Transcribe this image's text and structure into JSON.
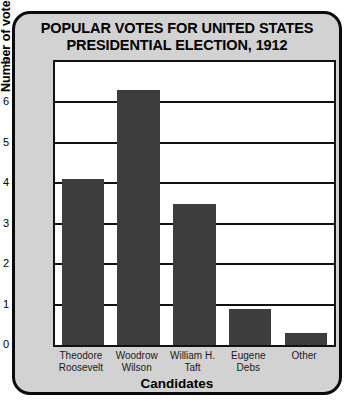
{
  "chart_data": {
    "type": "bar",
    "title": "POPULAR VOTES FOR UNITED STATES PRESIDENTIAL ELECTION, 1912",
    "title_lines": [
      "POPULAR VOTES FOR UNITED STATES",
      "PRESIDENTIAL ELECTION, 1912"
    ],
    "categories": [
      "Theodore Roosevelt",
      "Woodrow Wilson",
      "William H. Taft",
      "Eugene Debs",
      "Other"
    ],
    "category_lines": [
      [
        "Theodore",
        "Roosevelt"
      ],
      [
        "Woodrow",
        "Wilson"
      ],
      [
        "William H.",
        "Taft"
      ],
      [
        "Eugene",
        "Debs"
      ],
      [
        "Other",
        ""
      ]
    ],
    "values": [
      4.1,
      6.3,
      3.5,
      0.9,
      0.3
    ],
    "xlabel": "Candidates",
    "ylabel": "Number of votes (millions)",
    "ylim": [
      0,
      7
    ],
    "yticks": [
      0,
      1,
      2,
      3,
      4,
      5,
      6,
      7
    ],
    "ytick_labels": [
      "0",
      "1",
      "2",
      "3",
      "4",
      "5",
      "6",
      "7"
    ],
    "grid": true,
    "legend": "none",
    "bar_color": "#3d3d3d",
    "plot_background": "#ffffff",
    "panel_background": "#d2d2d2",
    "axis_color": "#111111"
  }
}
